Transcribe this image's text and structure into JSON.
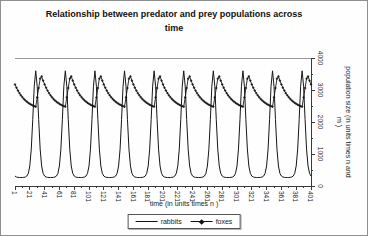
{
  "title_lines": [
    "Relationship between predator and prey populations across",
    "time"
  ],
  "chart_data": {
    "type": "line",
    "title": "Relationship between predator and prey populations across time",
    "xlabel": "time (in units times n )",
    "ylabel": "population size (in units times n and m )",
    "xlim": [
      1,
      401
    ],
    "ylim": [
      0,
      4000
    ],
    "x_ticks": [
      1,
      21,
      41,
      61,
      81,
      101,
      121,
      141,
      161,
      181,
      201,
      221,
      241,
      261,
      281,
      301,
      321,
      341,
      361,
      381,
      401
    ],
    "y_ticks": [
      0,
      1000,
      2000,
      3000,
      4000
    ],
    "grid": false,
    "y_axis_side": "right",
    "legend_position": "bottom",
    "axis_color": "#3a3a3a",
    "plot_top_border_color": "#9a9a9a",
    "x_start": 1,
    "x_step": 2,
    "series": [
      {
        "name": "rabbits",
        "color": "#161616",
        "marker": "none",
        "values": [
          311,
          281,
          270,
          266,
          266,
          266,
          270,
          281,
          311,
          396,
          626,
          1153,
          2073,
          3117,
          3600,
          3117,
          2073,
          1153,
          626,
          396,
          311,
          281,
          270,
          266,
          266,
          266,
          270,
          281,
          311,
          396,
          626,
          1153,
          2073,
          3117,
          3600,
          3117,
          2073,
          1153,
          626,
          396,
          311,
          281,
          270,
          266,
          266,
          266,
          270,
          281,
          311,
          396,
          626,
          1153,
          2073,
          3117,
          3600,
          3117,
          2073,
          1153,
          626,
          396,
          311,
          281,
          270,
          266,
          266,
          266,
          270,
          281,
          311,
          396,
          626,
          1153,
          2073,
          3117,
          3600,
          3117,
          2073,
          1153,
          626,
          396,
          311,
          281,
          270,
          266,
          266,
          266,
          270,
          281,
          311,
          396,
          626,
          1153,
          2073,
          3117,
          3600,
          3117,
          2073,
          1153,
          626,
          396,
          311,
          281,
          270,
          266,
          266,
          266,
          270,
          281,
          311,
          396,
          626,
          1153,
          2073,
          3117,
          3600,
          3117,
          2073,
          1153,
          626,
          396,
          311,
          281,
          270,
          266,
          266,
          266,
          270,
          281,
          311,
          396,
          626,
          1153,
          2073,
          3117,
          3600,
          3117,
          2073,
          1153,
          626,
          396,
          311,
          281,
          270,
          266,
          266,
          266,
          270,
          281,
          311,
          396,
          626,
          1153,
          2073,
          3117,
          3600,
          3117,
          2073,
          1153,
          626,
          396,
          311,
          281,
          270,
          266,
          266,
          266,
          270,
          281,
          311,
          396,
          626,
          1153,
          2073,
          3117,
          3600,
          3117,
          2073,
          1153,
          626,
          396,
          311,
          281,
          270,
          266,
          266,
          266,
          270,
          281,
          311,
          396,
          626,
          1153,
          2073,
          3117,
          3600,
          3117,
          2073,
          1153,
          626,
          396,
          311
        ]
      },
      {
        "name": "foxes",
        "color": "#161616",
        "marker": "plus",
        "values": [
          3174,
          3071,
          2981,
          2902,
          2833,
          2773,
          2720,
          2674,
          2634,
          2598,
          2567,
          2540,
          2516,
          2496,
          2477,
          2769,
          3062,
          3354,
          3426,
          3292,
          3174,
          3071,
          2981,
          2902,
          2833,
          2773,
          2720,
          2674,
          2634,
          2598,
          2567,
          2540,
          2516,
          2496,
          2477,
          2769,
          3062,
          3354,
          3426,
          3292,
          3174,
          3071,
          2981,
          2902,
          2833,
          2773,
          2720,
          2674,
          2634,
          2598,
          2567,
          2540,
          2516,
          2496,
          2477,
          2769,
          3062,
          3354,
          3426,
          3292,
          3174,
          3071,
          2981,
          2902,
          2833,
          2773,
          2720,
          2674,
          2634,
          2598,
          2567,
          2540,
          2516,
          2496,
          2477,
          2769,
          3062,
          3354,
          3426,
          3292,
          3174,
          3071,
          2981,
          2902,
          2833,
          2773,
          2720,
          2674,
          2634,
          2598,
          2567,
          2540,
          2516,
          2496,
          2477,
          2769,
          3062,
          3354,
          3426,
          3292,
          3174,
          3071,
          2981,
          2902,
          2833,
          2773,
          2720,
          2674,
          2634,
          2598,
          2567,
          2540,
          2516,
          2496,
          2477,
          2769,
          3062,
          3354,
          3426,
          3292,
          3174,
          3071,
          2981,
          2902,
          2833,
          2773,
          2720,
          2674,
          2634,
          2598,
          2567,
          2540,
          2516,
          2496,
          2477,
          2769,
          3062,
          3354,
          3426,
          3292,
          3174,
          3071,
          2981,
          2902,
          2833,
          2773,
          2720,
          2674,
          2634,
          2598,
          2567,
          2540,
          2516,
          2496,
          2477,
          2769,
          3062,
          3354,
          3426,
          3292,
          3174,
          3071,
          2981,
          2902,
          2833,
          2773,
          2720,
          2674,
          2634,
          2598,
          2567,
          2540,
          2516,
          2496,
          2477,
          2769,
          3062,
          3354,
          3426,
          3292,
          3174,
          3071,
          2981,
          2902,
          2833,
          2773,
          2720,
          2674,
          2634,
          2598,
          2567,
          2540,
          2516,
          2496,
          2477,
          2769,
          3062,
          3354,
          3426,
          3292,
          3174
        ]
      }
    ]
  }
}
